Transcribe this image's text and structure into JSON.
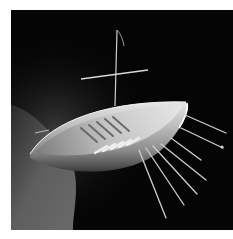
{
  "image": {
    "subject": "Gold boat model with mast, yard and oars on dark background",
    "alt": "Model boat with mast and oars",
    "colors": {
      "background_dark": "#050505",
      "floor_gray": "#5a5a5a",
      "hull_light": "#d8d8d8",
      "hull_mid": "#9a9a9a",
      "hull_shadow": "#3a3a3a",
      "wire": "#cfcfcf"
    }
  }
}
